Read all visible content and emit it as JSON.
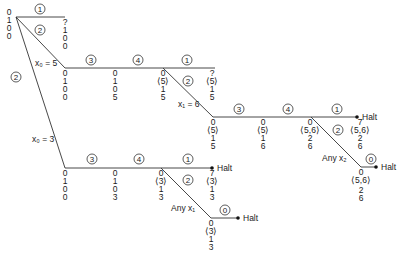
{
  "diagram": {
    "type": "computation-tree",
    "root_state": [
      "0",
      "1",
      "0",
      "0"
    ],
    "branch_labels": {
      "x0_eq_5": "x₀ = 5",
      "x0_eq_3": "x₀ = 3",
      "x1_eq_6": "x₁ = 6",
      "any_x1": "Any x₁",
      "any_x2": "Any x₂"
    },
    "halt_label": "Halt",
    "steps": {
      "s1": "1",
      "s2": "2",
      "s3": "3",
      "s4": "4",
      "s0": "0"
    },
    "states": {
      "root": [
        "0",
        "1",
        "0",
        "0"
      ],
      "top_q": [
        "?",
        "1",
        "0",
        "0"
      ],
      "a1": [
        "0",
        "1",
        "0",
        "0"
      ],
      "a2": [
        "0",
        "1",
        "0",
        "5"
      ],
      "a3": [
        "0",
        "⟨5⟩",
        "1",
        "5"
      ],
      "a4": [
        "?",
        "⟨5⟩",
        "1",
        "5"
      ],
      "b1": [
        "0",
        "⟨5⟩",
        "1",
        "5"
      ],
      "b2": [
        "0",
        "⟨5⟩",
        "1",
        "6"
      ],
      "b3": [
        "0",
        "⟨5,6⟩",
        "2",
        "6"
      ],
      "b4": [
        "7",
        "⟨5,6⟩",
        "2",
        "6"
      ],
      "b5": [
        "0",
        "⟨5,6⟩",
        "2",
        "6"
      ],
      "c1": [
        "0",
        "1",
        "0",
        "0"
      ],
      "c2": [
        "0",
        "1",
        "0",
        "3"
      ],
      "c3": [
        "0",
        "⟨3⟩",
        "1",
        "3"
      ],
      "c4": [
        "7",
        "⟨3⟩",
        "1",
        "3"
      ],
      "c5": [
        "0",
        "⟨3⟩",
        "1",
        "3"
      ]
    }
  }
}
